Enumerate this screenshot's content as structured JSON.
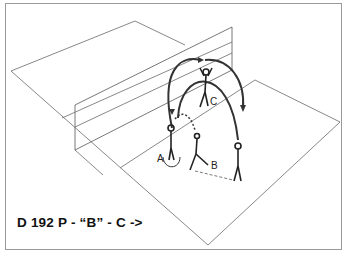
{
  "diagram": {
    "caption": "D 192  P - “B” - C ->",
    "players": [
      {
        "label": "A",
        "role": "setter-start"
      },
      {
        "label": "B",
        "role": "passer"
      },
      {
        "label": "C",
        "role": "net-player"
      }
    ],
    "elements": [
      "court",
      "net",
      "ball-trajectory-arcs",
      "movement-arrows"
    ],
    "colors": {
      "line": "#555555",
      "trajectory": "#333333",
      "background": "#ffffff"
    }
  }
}
